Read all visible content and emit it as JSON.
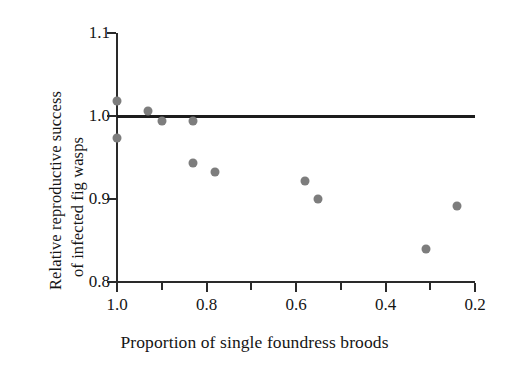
{
  "chart_data": {
    "type": "scatter",
    "title": "",
    "xlabel": "Proportion of single foundress broods",
    "ylabel_line1": "Relative reproductive success",
    "ylabel_line2": "of infected fig wasps",
    "xlim": [
      1.0,
      0.2
    ],
    "ylim": [
      0.8,
      1.1
    ],
    "x_reversed": true,
    "grid": false,
    "legend": null,
    "xticks": [
      1.0,
      0.8,
      0.6,
      0.4,
      0.2
    ],
    "xtick_labels": [
      "1.0",
      "0.8",
      "0.6",
      "0.4",
      "0.2"
    ],
    "xminor_ticks": [
      0.9,
      0.7,
      0.5,
      0.3
    ],
    "yticks": [
      1.1,
      1.0,
      0.9,
      0.8
    ],
    "ytick_labels": [
      "1.1",
      "1.0",
      "0.9",
      "0.8"
    ],
    "reference_line": {
      "orientation": "horizontal",
      "y": 1.0,
      "color": "#1c1c1c",
      "width_px": 3
    },
    "marker": {
      "shape": "circle",
      "color": "#7d7d7d",
      "size_px": 9
    },
    "points": [
      {
        "x": 1.0,
        "y": 1.018
      },
      {
        "x": 1.0,
        "y": 0.974
      },
      {
        "x": 0.93,
        "y": 1.006
      },
      {
        "x": 0.9,
        "y": 0.994
      },
      {
        "x": 0.83,
        "y": 0.994
      },
      {
        "x": 0.83,
        "y": 0.943
      },
      {
        "x": 0.78,
        "y": 0.932
      },
      {
        "x": 0.58,
        "y": 0.922
      },
      {
        "x": 0.55,
        "y": 0.9
      },
      {
        "x": 0.31,
        "y": 0.84
      },
      {
        "x": 0.24,
        "y": 0.891
      }
    ]
  },
  "colors": {
    "axis": "#2a2a2a",
    "text": "#151515",
    "marker": "#7d7d7d",
    "reference_line": "#1c1c1c",
    "background": "#ffffff"
  }
}
